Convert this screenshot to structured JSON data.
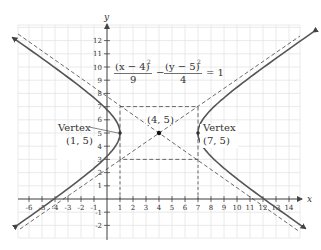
{
  "figure": {
    "axes": {
      "x_label": "x",
      "y_label": "y",
      "x_ticks": [
        "-6",
        "-5",
        "-4",
        "-3",
        "-2",
        "-1",
        "1",
        "2",
        "3",
        "4",
        "5",
        "6",
        "7",
        "8",
        "9",
        "10",
        "11",
        "12",
        "13",
        "14"
      ],
      "y_ticks": [
        "-2",
        "-1",
        "1",
        "2",
        "3",
        "4",
        "5",
        "6",
        "7",
        "8",
        "9",
        "10",
        "11",
        "12"
      ]
    },
    "equation": {
      "num1": "(x − 4)",
      "exp1": "2",
      "den1": "9",
      "minus": "−",
      "num2": "(y − 5)",
      "exp2": "2",
      "den2": "4",
      "rhs": "= 1"
    },
    "labels": {
      "center": "(4, 5)",
      "left_vertex_title": "Vertex",
      "left_vertex_coords": "(1, 5)",
      "right_vertex_title": "Vertex",
      "right_vertex_coords": "(7, 5)"
    },
    "colors": {
      "curve": "#555555",
      "grid": "#e2e2e2",
      "axis": "#333333",
      "dashed": "#444444"
    }
  },
  "chart_data": {
    "type": "line",
    "xlabel": "x",
    "ylabel": "y",
    "xlim": [
      -6.8,
      14.8
    ],
    "ylim": [
      -2.9,
      13.2
    ],
    "grid": true,
    "center": [
      4,
      5
    ],
    "vertices": [
      [
        1,
        5
      ],
      [
        7,
        5
      ]
    ],
    "a": 3,
    "b": 2,
    "asymptotes": [
      "y − 5 = (2/3)(x − 4)",
      "y − 5 = −(2/3)(x − 4)"
    ],
    "fundamental_rectangle": [
      [
        1,
        3
      ],
      [
        7,
        3
      ],
      [
        7,
        7
      ],
      [
        1,
        7
      ]
    ],
    "series": [
      {
        "name": "left branch",
        "x": [
          -6.3,
          -4,
          -2,
          0,
          1,
          0,
          -2,
          -4,
          -6.8
        ],
        "y": [
          -2.0,
          -0.1,
          1.3,
          2.9,
          5,
          7.1,
          8.7,
          10.1,
          12.3
        ]
      },
      {
        "name": "right branch",
        "x": [
          14.7,
          12,
          10,
          8,
          7,
          8,
          10,
          12,
          15
        ],
        "y": [
          12.6,
          9.9,
          8.5,
          6.9,
          5,
          3.1,
          1.5,
          0.1,
          -2.3
        ]
      }
    ]
  }
}
